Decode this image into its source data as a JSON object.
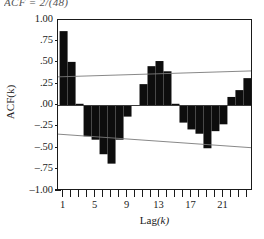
{
  "figure": {
    "name": "acf-correlogram",
    "formula_fragment_left": "ACF",
    "formula_fragment_right": "= 2/(48)"
  },
  "axes": {
    "y_title": "ACF(k)",
    "x_title_main": "Lag",
    "x_title_var": "(k)",
    "y_ticks": [
      "1.00",
      ".75",
      ".50",
      ".25",
      ".00",
      "–.25",
      "–.50",
      "–.75",
      "–1.00"
    ],
    "y_tick_values": [
      1.0,
      0.75,
      0.5,
      0.25,
      0.0,
      -0.25,
      -0.5,
      -0.75,
      -1.0
    ],
    "x_ticks": [
      "1",
      "5",
      "9",
      "13",
      "17",
      "21"
    ],
    "x_tick_values": [
      1,
      5,
      9,
      13,
      17,
      21
    ]
  },
  "colors": {
    "bar": "#0d0d0d",
    "frame": "#1a1a1a",
    "zero_line": "#3a3a3a",
    "confidence_line": "#7a7a7a",
    "background": "#ffffff"
  },
  "chart_data": {
    "type": "bar",
    "title": "",
    "subtitle": "",
    "xlabel": "Lag(k)",
    "ylabel": "ACF(k)",
    "xlim": [
      0.3,
      24.7
    ],
    "ylim": [
      -1.0,
      1.0
    ],
    "grid": false,
    "legend": "none",
    "categories": [
      1,
      2,
      3,
      4,
      5,
      6,
      7,
      8,
      9,
      10,
      11,
      12,
      13,
      14,
      15,
      16,
      17,
      18,
      19,
      20,
      21,
      22,
      23,
      24
    ],
    "values": [
      0.87,
      0.51,
      0.02,
      -0.36,
      -0.4,
      -0.57,
      -0.68,
      -0.4,
      -0.13,
      0.0,
      0.25,
      0.46,
      0.52,
      0.4,
      0.02,
      -0.2,
      -0.28,
      -0.33,
      -0.5,
      -0.3,
      -0.22,
      0.1,
      0.18,
      0.32
    ],
    "reference_lines": [
      {
        "name": "zero-line",
        "type": "horizontal",
        "y": 0.0
      },
      {
        "name": "upper-confidence-band",
        "type": "sloped",
        "y_start": 0.335,
        "y_end": 0.405
      },
      {
        "name": "lower-confidence-band",
        "type": "sloped",
        "y_start": -0.335,
        "y_end": -0.495
      }
    ]
  }
}
